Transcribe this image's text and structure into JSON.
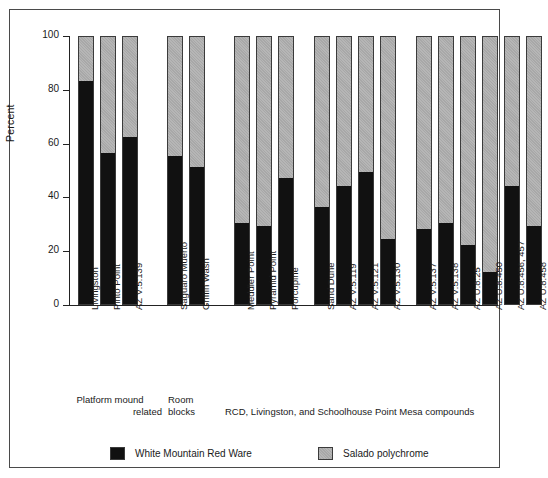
{
  "chart_data": {
    "type": "bar",
    "stacked": true,
    "title": "",
    "subtitle": "",
    "xlabel": "",
    "ylabel": "Percent",
    "ylim": [
      0,
      100
    ],
    "yticks": [
      0,
      20,
      40,
      60,
      80,
      100
    ],
    "grid": false,
    "legend_position": "bottom",
    "categories": [
      "Livingston",
      "Pinto Point",
      "AZ V:5:139",
      "Saguaro Muerto",
      "Griffin Wash",
      "Meddler Point",
      "Pyramid Point",
      "Porcupine",
      "Sand Dune",
      "AZ V:5:119",
      "AZ V:5:121",
      "AZ V:5:130",
      "AZ V:5:137",
      "AZ V:5:138",
      "AZ U:8:25",
      "AZ U:8:450",
      "AZ U:8:456, 457",
      "AZ U:8:458"
    ],
    "series": [
      {
        "name": "White Mountain Red Ware",
        "color": "#111111",
        "values": [
          83,
          56,
          62,
          55,
          51,
          30,
          29,
          47,
          36,
          44,
          49,
          24,
          28,
          30,
          22,
          12,
          44,
          29
        ]
      },
      {
        "name": "Salado polychrome",
        "color": "#a8a8a8",
        "values": [
          17,
          44,
          38,
          45,
          49,
          70,
          71,
          53,
          64,
          56,
          51,
          76,
          72,
          70,
          78,
          88,
          56,
          71
        ]
      }
    ],
    "groups": [
      {
        "label_lines": [
          "Platform  mound",
          "related"
        ],
        "categories": [
          "Livingston",
          "Pinto Point",
          "AZ V:5:139"
        ]
      },
      {
        "label_lines": [
          "Room",
          "blocks"
        ],
        "categories": [
          "Saguaro Muerto",
          "Griffin Wash"
        ]
      },
      {
        "label_lines": [
          "RCD, Livingston, and Schoolhouse Point Mesa compounds"
        ],
        "categories": [
          "Meddler Point",
          "Pyramid Point",
          "Porcupine",
          "Sand Dune",
          "AZ V:5:119",
          "AZ V:5:121",
          "AZ V:5:130",
          "AZ V:5:137",
          "AZ V:5:138",
          "AZ U:8:25",
          "AZ U:8:450",
          "AZ U:8:456, 457",
          "AZ U:8:458"
        ]
      }
    ]
  },
  "axis": {
    "y_label": "Percent",
    "y_ticks": [
      "0",
      "20",
      "40",
      "60",
      "80",
      "100"
    ]
  },
  "group_captions": {
    "platform_line1": "Platform  mound",
    "platform_line2": "related",
    "roomblocks_line1": "Room",
    "roomblocks_line2": "blocks",
    "compounds": "RCD, Livingston, and Schoolhouse Point Mesa compounds"
  },
  "legend": {
    "items": [
      {
        "label": "White Mountain Red Ware",
        "color": "#111111"
      },
      {
        "label": "Salado polychrome",
        "color": "#a8a8a8"
      }
    ]
  }
}
